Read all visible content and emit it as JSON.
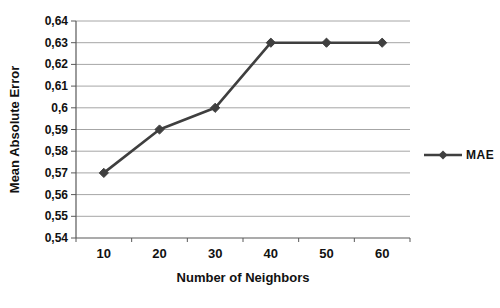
{
  "chart_data": {
    "type": "line",
    "title": "",
    "xlabel": "Number of Neighbors",
    "ylabel": "Mean Absolute Error",
    "categories": [
      "10",
      "20",
      "30",
      "40",
      "50",
      "60"
    ],
    "series": [
      {
        "name": "MAE",
        "values": [
          0.57,
          0.59,
          0.6,
          0.63,
          0.63,
          0.63
        ]
      }
    ],
    "ylim": [
      0.54,
      0.64
    ],
    "y_tick_step": 0.01,
    "y_tick_labels": [
      "0,64",
      "0,63",
      "0,62",
      "0,61",
      "0,6",
      "0,59",
      "0,58",
      "0,57",
      "0,56",
      "0,55",
      "0,54"
    ],
    "grid": "horizontal-only",
    "legend": {
      "position": "right",
      "entries": [
        "MAE"
      ]
    },
    "marker": "diamond",
    "colors": {
      "series": "#3f3f3f",
      "gridline": "#a6a6a6",
      "axis": "#595959",
      "text": "#111111",
      "background": "#ffffff"
    }
  }
}
